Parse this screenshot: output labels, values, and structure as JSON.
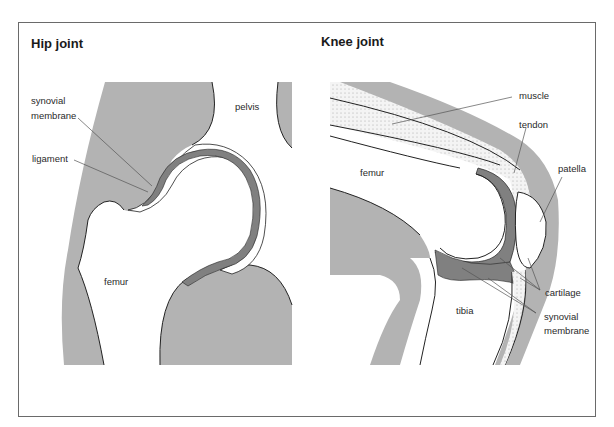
{
  "colors": {
    "tissue_gray": "#b3b3b3",
    "cartilage_dark": "#808080",
    "outline": "#222222",
    "frame": "#6a6a6a"
  },
  "hip": {
    "title": "Hip joint",
    "labels": {
      "synovial_1": "synovial",
      "synovial_2": "membrane",
      "ligament": "ligament",
      "pelvis": "pelvis",
      "femur": "femur"
    }
  },
  "knee": {
    "title": "Knee joint",
    "labels": {
      "muscle": "muscle",
      "tendon": "tendon",
      "patella": "patella",
      "femur": "femur",
      "tibia": "tibia",
      "cartilage": "cartilage",
      "synovial_1": "synovial",
      "synovial_2": "membrane"
    }
  }
}
